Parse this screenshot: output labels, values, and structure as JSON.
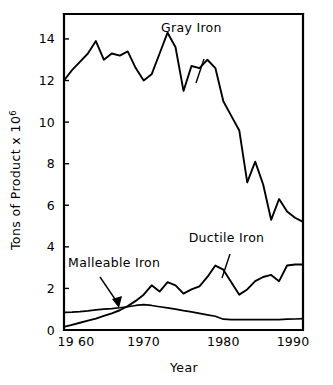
{
  "chart_data": {
    "type": "line",
    "title": "",
    "xlabel": "Year",
    "ylabel": "Tons of Product x 10",
    "ylabel_exponent": "6",
    "xlim": [
      1960,
      1990
    ],
    "ylim": [
      0,
      15.2
    ],
    "grid": false,
    "legend_position": "inline-annotations",
    "xticks": [
      1960,
      1970,
      1980,
      1990
    ],
    "xticklabels": [
      "19 60",
      "1970",
      "1980",
      "1990"
    ],
    "yticks": [
      0,
      2,
      4,
      6,
      8,
      10,
      12,
      14
    ],
    "yticklabels": [
      "0",
      "2",
      "4",
      "6",
      "8",
      "10",
      "12",
      "14"
    ],
    "annotations": [
      {
        "id": "gray-iron",
        "text": "Gray Iron",
        "x": 1976.0,
        "y": 14.35
      },
      {
        "id": "ductile-iron",
        "text": "Ductile Iron",
        "x": 1980.4,
        "y": 4.25
      },
      {
        "id": "malleable-iron",
        "text": "Malleable Iron",
        "x": 1966.3,
        "y": 3.05
      }
    ],
    "series": [
      {
        "name": "Gray Iron",
        "x": [
          1960,
          1961,
          1962,
          1963,
          1964,
          1965,
          1966,
          1967,
          1968,
          1969,
          1970,
          1971,
          1972,
          1973,
          1974,
          1975,
          1976,
          1977,
          1978,
          1979,
          1980,
          1981,
          1982,
          1983,
          1984,
          1985,
          1986,
          1987,
          1988,
          1989,
          1990
        ],
        "values": [
          12.0,
          12.5,
          12.9,
          13.3,
          13.9,
          13.0,
          13.3,
          13.2,
          13.4,
          12.6,
          12.0,
          12.3,
          13.3,
          14.3,
          13.6,
          11.5,
          12.7,
          12.6,
          13.0,
          12.6,
          11.0,
          10.3,
          9.6,
          7.1,
          8.1,
          7.0,
          5.3,
          6.3,
          5.7,
          5.4,
          5.2
        ]
      },
      {
        "name": "Ductile Iron",
        "x": [
          1960,
          1961,
          1962,
          1963,
          1964,
          1965,
          1966,
          1967,
          1968,
          1969,
          1970,
          1971,
          1972,
          1973,
          1974,
          1975,
          1976,
          1977,
          1978,
          1979,
          1980,
          1981,
          1982,
          1983,
          1984,
          1985,
          1986,
          1987,
          1988,
          1989,
          1990
        ],
        "values": [
          0.15,
          0.25,
          0.35,
          0.45,
          0.55,
          0.68,
          0.8,
          0.95,
          1.15,
          1.4,
          1.7,
          2.15,
          1.85,
          2.3,
          2.15,
          1.75,
          1.95,
          2.1,
          2.55,
          3.1,
          2.9,
          2.3,
          1.7,
          1.95,
          2.35,
          2.55,
          2.65,
          2.35,
          3.1,
          3.15,
          3.15
        ]
      },
      {
        "name": "Malleable Iron",
        "x": [
          1960,
          1961,
          1962,
          1963,
          1964,
          1965,
          1966,
          1967,
          1968,
          1969,
          1970,
          1971,
          1972,
          1973,
          1974,
          1975,
          1976,
          1977,
          1978,
          1979,
          1980,
          1981,
          1982,
          1983,
          1984,
          1985,
          1986,
          1987,
          1988,
          1989,
          1990
        ],
        "values": [
          0.85,
          0.86,
          0.88,
          0.92,
          0.97,
          1.0,
          1.03,
          1.07,
          1.12,
          1.18,
          1.22,
          1.18,
          1.12,
          1.06,
          1.0,
          0.93,
          0.87,
          0.8,
          0.73,
          0.66,
          0.52,
          0.5,
          0.5,
          0.5,
          0.5,
          0.5,
          0.5,
          0.5,
          0.52,
          0.53,
          0.55
        ]
      }
    ]
  }
}
